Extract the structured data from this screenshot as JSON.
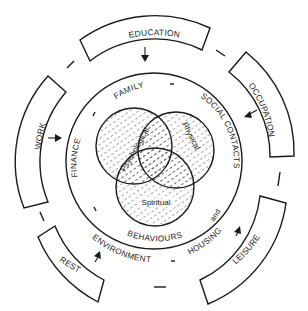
{
  "diagram": {
    "title": "",
    "colors": {
      "stroke": "#1a1a1a",
      "background": "#ffffff",
      "hatch": "#333333"
    },
    "outer_factors": [
      {
        "label": "EDUCATION",
        "position": "top"
      },
      {
        "label": "OCCUPATION",
        "position": "upper-right"
      },
      {
        "label": "LEISURE",
        "position": "lower-right"
      },
      {
        "label": "REST",
        "position": "lower-left"
      },
      {
        "label": "WORK",
        "position": "left"
      }
    ],
    "ring_labels": {
      "family": "FAMILY",
      "social_contacts": "SOCIAL CONTACTS",
      "and": "and",
      "behaviours": "BEHAVIOURS",
      "finance": "FINANCE",
      "environment": "ENVIRONMENT",
      "housing": "HOUSING"
    },
    "core_dimensions": [
      {
        "label": "Psychological"
      },
      {
        "label": "Physical"
      },
      {
        "label": "Spiritual"
      }
    ]
  }
}
